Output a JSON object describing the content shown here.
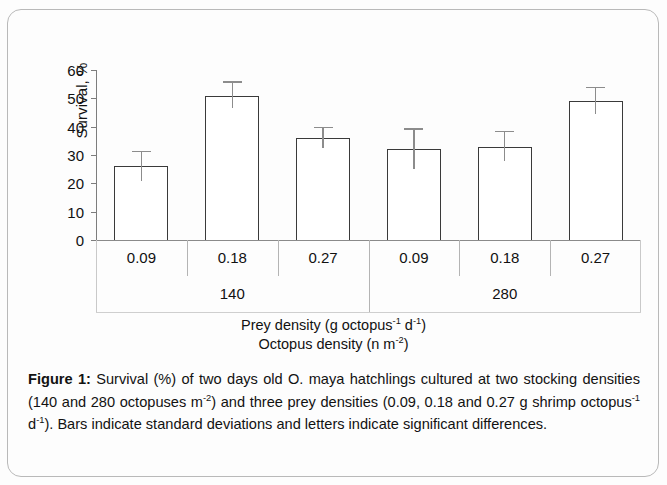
{
  "figure": {
    "label": "Figure 1:",
    "caption_text": " Survival (%) of two days old O. maya hatchlings cultured at two stocking densities (140 and 280 octopuses m-2) and three prey densities (0.09, 0.18 and 0.27 g shrimp octopus-1 d-1). Bars indicate standard deviations and letters indicate significant differences.",
    "caption_parts": {
      "p1": " Survival (%) of two days old O. maya hatchlings cultured at two stocking densities (140 and 280 octopuses m",
      "sup1": "-2",
      "p2": ") and three prey densities (0.09, 0.18 and 0.27 g shrimp octopus",
      "sup2": "-1",
      "p3": " d",
      "sup3": "-1",
      "p4": "). Bars indicate standard deviations and letters indicate significant differences."
    }
  },
  "axis_titles": {
    "prey_density": {
      "pre": "Prey density (g octopus",
      "sup1": "-1",
      "mid": " d",
      "sup2": "-1",
      "post": ")"
    },
    "octopus_density": {
      "pre": "Octopus density (n m",
      "sup1": "-2",
      "post": ")"
    }
  },
  "chart_data": {
    "type": "bar",
    "title": "",
    "xlabel": "Prey density (g octopus-1 d-1) / Octopus density (n m-2)",
    "ylabel": "Survival, %",
    "ylim": [
      0,
      60
    ],
    "yticks": [
      0,
      10,
      20,
      30,
      40,
      50,
      60
    ],
    "ytick_labels": [
      "0",
      "10",
      "20",
      "30",
      "40",
      "50",
      "60"
    ],
    "grid": false,
    "legend": "none",
    "group_label_title": "Octopus density",
    "groups": [
      {
        "name": "140",
        "categories": [
          "0.09",
          "0.18",
          "0.27"
        ],
        "values": [
          26,
          51,
          36
        ],
        "errors": [
          5,
          4.5,
          3.5
        ]
      },
      {
        "name": "280",
        "categories": [
          "0.09",
          "0.18",
          "0.27"
        ],
        "values": [
          32,
          33,
          49
        ],
        "errors": [
          7,
          5,
          4.5
        ]
      }
    ],
    "categories": [
      "0.09",
      "0.18",
      "0.27",
      "0.09",
      "0.18",
      "0.27"
    ],
    "values": [
      26,
      51,
      36,
      32,
      33,
      49
    ],
    "errors": [
      5,
      4.5,
      3.5,
      7,
      5,
      4.5
    ],
    "bar_fill": "#ffffff",
    "bar_edge": "#3a3a3a",
    "error_color": "#8c8c8c",
    "axis_color": "#7d7d7d"
  }
}
